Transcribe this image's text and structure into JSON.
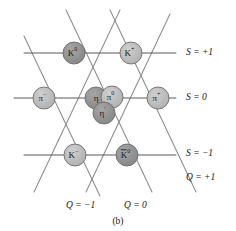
{
  "figure": {
    "caption": "(b)",
    "type": "meson-nonet-weight-diagram"
  },
  "colors": {
    "line": "#8c8c8c",
    "axis_line": "#5a5a5a",
    "node_dark": "#8e8e8e",
    "node_light": "#b9b9b9",
    "node_stroke": "#6d6d6d",
    "text": "#161616",
    "background": "#ffffff"
  },
  "axes": {
    "strangeness_labels": [
      {
        "id": "s-plus-1",
        "text": "S = +1",
        "x": 186,
        "y": 55
      },
      {
        "id": "s-zero",
        "text": "S = 0",
        "x": 186,
        "y": 100
      },
      {
        "id": "s-minus-1",
        "text": "S = −1",
        "x": 186,
        "y": 156
      }
    ],
    "charge_labels": [
      {
        "id": "q-plus-1",
        "text": "Q = +1",
        "x": 186,
        "y": 180
      },
      {
        "id": "q-minus-1",
        "text": "Q = −1",
        "x": 66,
        "y": 208
      },
      {
        "id": "q-zero",
        "text": "Q = 0",
        "x": 124,
        "y": 208
      }
    ]
  },
  "nodes": [
    {
      "id": "k-zero",
      "base": "K",
      "sup": "0",
      "x": 74,
      "y": 53,
      "r": 11,
      "shade": "dark",
      "row": "S = +1"
    },
    {
      "id": "k-plus",
      "base": "K",
      "sup": "+",
      "x": 131,
      "y": 53,
      "r": 11,
      "shade": "light",
      "row": "S = +1"
    },
    {
      "id": "pi-minus",
      "base": "π",
      "sup": "−",
      "x": 44,
      "y": 98,
      "r": 11,
      "shade": "light",
      "row": "S = 0"
    },
    {
      "id": "eta",
      "base": "η",
      "sup": "",
      "x": 96,
      "y": 98,
      "r": 11,
      "shade": "dark",
      "row": "S = 0"
    },
    {
      "id": "pi-zero",
      "base": "π",
      "sup": "0",
      "x": 112,
      "y": 97,
      "r": 11,
      "shade": "light",
      "row": "S = 0"
    },
    {
      "id": "eta-prime",
      "base": "η",
      "sup": "′",
      "x": 104,
      "y": 113,
      "r": 11,
      "shade": "dark",
      "row": "S = 0"
    },
    {
      "id": "pi-plus",
      "base": "π",
      "sup": "+",
      "x": 158,
      "y": 98,
      "r": 11,
      "shade": "light",
      "row": "S = 0"
    },
    {
      "id": "k-minus",
      "base": "K",
      "sup": "−",
      "x": 75,
      "y": 155,
      "r": 11,
      "shade": "light",
      "row": "S = −1"
    },
    {
      "id": "k-zero-bar",
      "base": "K",
      "sup": "0",
      "x": 127,
      "y": 155,
      "r": 11,
      "shade": "dark",
      "row": "S = −1",
      "overbar": true
    }
  ],
  "lines": {
    "horizontal": [
      {
        "id": "row-s-plus-1",
        "x1": 24,
        "y1": 53,
        "x2": 176,
        "y2": 53
      },
      {
        "id": "row-s-zero",
        "x1": 14,
        "y1": 98,
        "x2": 176,
        "y2": 98
      },
      {
        "id": "row-s-minus-1",
        "x1": 24,
        "y1": 155,
        "x2": 176,
        "y2": 155
      }
    ],
    "diagonal_down_right": [
      {
        "id": "diag-a",
        "x1": 24,
        "y1": 36,
        "x2": 100,
        "y2": 196
      },
      {
        "id": "diag-b",
        "x1": 66,
        "y1": 10,
        "x2": 152,
        "y2": 192
      },
      {
        "id": "diag-c",
        "x1": 110,
        "y1": 10,
        "x2": 196,
        "y2": 192
      }
    ],
    "diagonal_down_left": [
      {
        "id": "diag-d",
        "x1": 120,
        "y1": 10,
        "x2": 34,
        "y2": 192
      },
      {
        "id": "diag-e",
        "x1": 170,
        "y1": 14,
        "x2": 86,
        "y2": 192
      }
    ]
  }
}
